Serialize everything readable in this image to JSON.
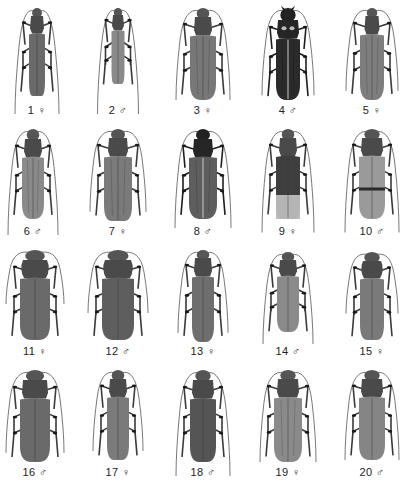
{
  "plate": {
    "background": "#ffffff",
    "label_color": "#222222",
    "specimens": [
      {
        "number": "1",
        "sex": "♀",
        "sex_name": "female",
        "cx": 37,
        "top": 6,
        "len": 88,
        "w": 16,
        "pro_w": 14,
        "head": 8,
        "shade": "#6a6a6a",
        "ant": 1.25,
        "taper": 0.55,
        "pattern": "plain"
      },
      {
        "number": "2",
        "sex": "♂",
        "sex_name": "male",
        "cx": 118,
        "top": 6,
        "len": 76,
        "w": 13,
        "pro_w": 12,
        "head": 7,
        "shade": "#8a8a8a",
        "ant": 1.4,
        "taper": 0.6,
        "pattern": "plain"
      },
      {
        "number": "3",
        "sex": "♀",
        "sex_name": "female",
        "cx": 203,
        "top": 6,
        "len": 92,
        "w": 26,
        "pro_w": 18,
        "head": 9,
        "shade": "#777777",
        "ant": 1.0,
        "taper": 0.15,
        "pattern": "stripe"
      },
      {
        "number": "4",
        "sex": "♂",
        "sex_name": "male",
        "cx": 288,
        "top": 6,
        "len": 92,
        "w": 24,
        "pro_w": 22,
        "head": 12,
        "shade": "#2a2a2a",
        "ant": 0.95,
        "taper": 0.15,
        "pattern": "dark"
      },
      {
        "number": "5",
        "sex": "♀",
        "sex_name": "female",
        "cx": 372,
        "top": 6,
        "len": 92,
        "w": 24,
        "pro_w": 15,
        "head": 8,
        "shade": "#7e7e7e",
        "ant": 0.9,
        "taper": 0.2,
        "pattern": "stripe"
      },
      {
        "number": "6",
        "sex": "♂",
        "sex_name": "male",
        "cx": 33,
        "top": 127,
        "len": 90,
        "w": 22,
        "pro_w": 18,
        "head": 10,
        "shade": "#8a8a8a",
        "ant": 1.2,
        "taper": 0.15,
        "pattern": "stripe"
      },
      {
        "number": "7",
        "sex": "♀",
        "sex_name": "female",
        "cx": 118,
        "top": 127,
        "len": 92,
        "w": 28,
        "pro_w": 20,
        "head": 9,
        "shade": "#7a7a7a",
        "ant": 0.9,
        "taper": 0.45,
        "pattern": "stripe"
      },
      {
        "number": "8",
        "sex": "♂",
        "sex_name": "male",
        "cx": 203,
        "top": 127,
        "len": 90,
        "w": 28,
        "pro_w": 20,
        "head": 10,
        "shade": "#5e5e5e",
        "ant": 1.1,
        "taper": 0.2,
        "pattern": "dark"
      },
      {
        "number": "9",
        "sex": "♀",
        "sex_name": "female",
        "cx": 288,
        "top": 127,
        "len": 90,
        "w": 24,
        "pro_w": 18,
        "head": 9,
        "shade": "#3e3e3e",
        "ant": 1.15,
        "taper": 0.45,
        "pattern": "bicolor"
      },
      {
        "number": "10",
        "sex": "♂",
        "sex_name": "male",
        "cx": 372,
        "top": 127,
        "len": 90,
        "w": 26,
        "pro_w": 22,
        "head": 9,
        "shade": "#9a9a9a",
        "ant": 1.15,
        "taper": 0.2,
        "pattern": "band"
      },
      {
        "number": "11",
        "sex": "♀",
        "sex_name": "female",
        "cx": 35,
        "top": 248,
        "len": 90,
        "w": 30,
        "pro_w": 28,
        "head": 10,
        "shade": "#6a6a6a",
        "ant": 0.6,
        "taper": 0.25,
        "pattern": "round"
      },
      {
        "number": "12",
        "sex": "♂",
        "sex_name": "male",
        "cx": 118,
        "top": 248,
        "len": 90,
        "w": 32,
        "pro_w": 30,
        "head": 10,
        "shade": "#5e5e5e",
        "ant": 0.7,
        "taper": 0.3,
        "pattern": "round"
      },
      {
        "number": "13",
        "sex": "♀",
        "sex_name": "female",
        "cx": 203,
        "top": 248,
        "len": 92,
        "w": 22,
        "pro_w": 18,
        "head": 8,
        "shade": "#6e6e6e",
        "ant": 0.9,
        "taper": 0.25,
        "pattern": "plain"
      },
      {
        "number": "14",
        "sex": "♂",
        "sex_name": "male",
        "cx": 288,
        "top": 250,
        "len": 80,
        "w": 22,
        "pro_w": 18,
        "head": 8,
        "shade": "#8a8a8a",
        "ant": 1.15,
        "taper": 0.2,
        "pattern": "plain"
      },
      {
        "number": "15",
        "sex": "♀",
        "sex_name": "female",
        "cx": 372,
        "top": 250,
        "len": 88,
        "w": 24,
        "pro_w": 22,
        "head": 9,
        "shade": "#7a7a7a",
        "ant": 0.7,
        "taper": 0.35,
        "pattern": "round"
      },
      {
        "number": "16",
        "sex": "♂",
        "sex_name": "male",
        "cx": 35,
        "top": 368,
        "len": 92,
        "w": 30,
        "pro_w": 26,
        "head": 10,
        "shade": "#6a6a6a",
        "ant": 0.9,
        "taper": 0.25,
        "pattern": "plain"
      },
      {
        "number": "17",
        "sex": "♀",
        "sex_name": "female",
        "cx": 118,
        "top": 368,
        "len": 90,
        "w": 22,
        "pro_w": 18,
        "head": 9,
        "shade": "#7a7a7a",
        "ant": 0.9,
        "taper": 0.35,
        "pattern": "plain"
      },
      {
        "number": "18",
        "sex": "♂",
        "sex_name": "male",
        "cx": 203,
        "top": 368,
        "len": 92,
        "w": 26,
        "pro_w": 22,
        "head": 10,
        "shade": "#555555",
        "ant": 1.2,
        "taper": 0.3,
        "pattern": "plain"
      },
      {
        "number": "19",
        "sex": "♀",
        "sex_name": "female",
        "cx": 288,
        "top": 368,
        "len": 92,
        "w": 28,
        "pro_w": 22,
        "head": 9,
        "shade": "#8a8a8a",
        "ant": 1.0,
        "taper": 0.25,
        "pattern": "stripe"
      },
      {
        "number": "20",
        "sex": "♂",
        "sex_name": "male",
        "cx": 372,
        "top": 368,
        "len": 90,
        "w": 26,
        "pro_w": 22,
        "head": 9,
        "shade": "#858585",
        "ant": 1.0,
        "taper": 0.2,
        "pattern": "plain"
      }
    ],
    "label_rows_y": [
      104,
      225,
      345,
      466
    ]
  }
}
